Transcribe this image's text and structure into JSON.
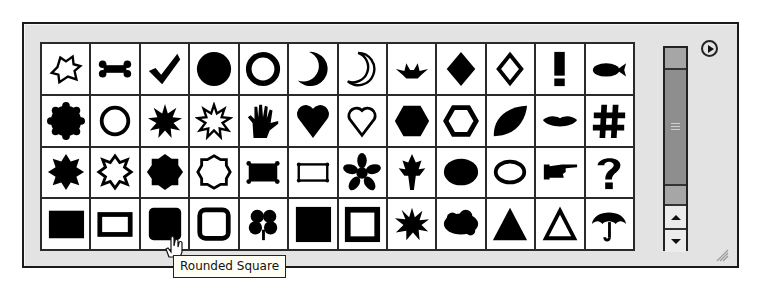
{
  "panel": {
    "title": "Custom Shape Picker",
    "menu_icon": "circle-play-menu-icon",
    "resize_icon": "resize-grip-icon"
  },
  "shapes": [
    [
      "Blob Outline",
      "Bone",
      "Checkmark",
      "Circle",
      "Circle Frame",
      "Moon",
      "Moon Frame",
      "Crown",
      "Diamond",
      "Diamond Frame",
      "Exclamation Point",
      "Fish"
    ],
    [
      "Seal",
      "Seal Frame",
      "Sun",
      "Sun Frame",
      "Hand",
      "Heart",
      "Heart Frame",
      "Hexagon",
      "Hexagon Frame",
      "Leaf",
      "Lips",
      "Hash"
    ],
    [
      "Octagon Star",
      "Octagon Star Frame",
      "Sign",
      "Sign Frame",
      "Banner",
      "Banner Frame",
      "Flower",
      "Maple Leaf",
      "Oval",
      "Oval Frame",
      "Pointing Hand",
      "Question Mark"
    ],
    [
      "Square",
      "Square Frame",
      "Rounded Square",
      "Rounded Square Frame",
      "Clover",
      "Tall Square",
      "Tall Square Frame",
      "Starburst",
      "Cloud",
      "Triangle",
      "Triangle Frame",
      "Umbrella"
    ]
  ],
  "hovered_shape": "Rounded Square",
  "tooltip": {
    "text": "Rounded Square"
  },
  "scrollbar": {
    "up_label": "▲",
    "down_label": "▼"
  },
  "colors": {
    "panel_bg": "#e3e3e3",
    "grid_line": "#2a2a2a",
    "cell_bg": "#ffffff",
    "thumb": "#8e8e8e",
    "tooltip_bg": "#fffff6"
  }
}
